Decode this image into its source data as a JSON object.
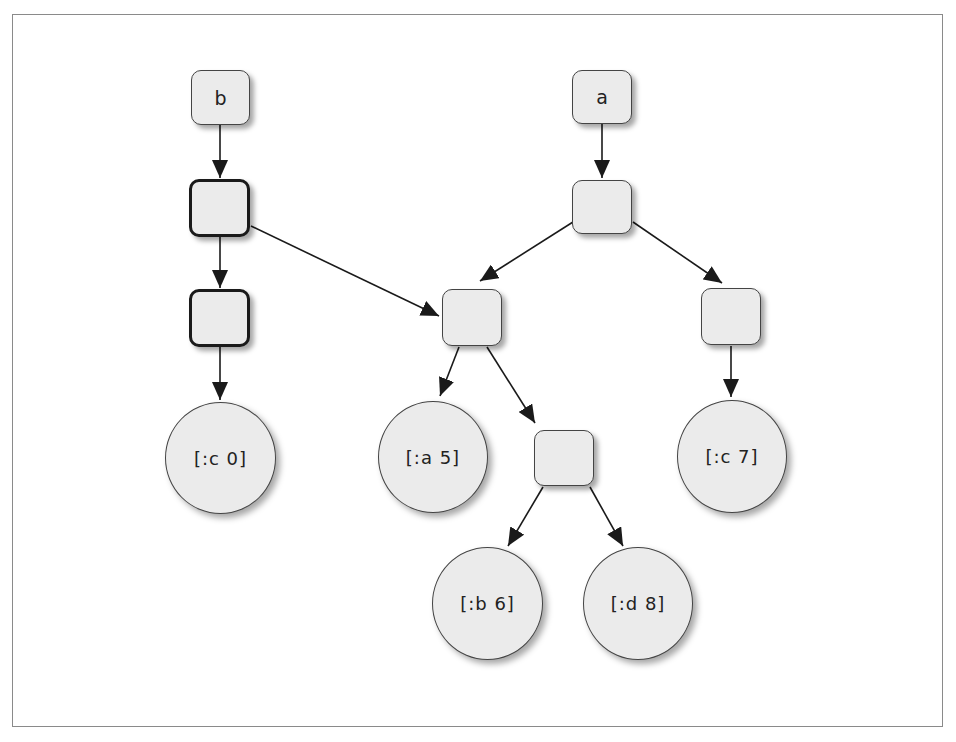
{
  "diagram": {
    "type": "persistent-tree-structural-sharing",
    "roots": [
      {
        "id": "b",
        "label": "b"
      },
      {
        "id": "a",
        "label": "a"
      }
    ],
    "nodes": [
      {
        "id": "b",
        "label": "b",
        "shape": "box"
      },
      {
        "id": "b1",
        "label": "",
        "shape": "box",
        "emphasis": "thick"
      },
      {
        "id": "b2",
        "label": "",
        "shape": "box",
        "emphasis": "thick"
      },
      {
        "id": "c0",
        "label": "[:c 0]",
        "shape": "circle"
      },
      {
        "id": "a",
        "label": "a",
        "shape": "box"
      },
      {
        "id": "a1",
        "label": "",
        "shape": "box"
      },
      {
        "id": "m",
        "label": "",
        "shape": "box"
      },
      {
        "id": "r",
        "label": "",
        "shape": "box"
      },
      {
        "id": "a5",
        "label": "[:a 5]",
        "shape": "circle"
      },
      {
        "id": "n",
        "label": "",
        "shape": "box"
      },
      {
        "id": "c7",
        "label": "[:c 7]",
        "shape": "circle"
      },
      {
        "id": "b6",
        "label": "[:b 6]",
        "shape": "circle"
      },
      {
        "id": "d8",
        "label": "[:d 8]",
        "shape": "circle"
      }
    ],
    "edges": [
      {
        "from": "b",
        "to": "b1"
      },
      {
        "from": "b1",
        "to": "b2"
      },
      {
        "from": "b1",
        "to": "m"
      },
      {
        "from": "b2",
        "to": "c0"
      },
      {
        "from": "a",
        "to": "a1"
      },
      {
        "from": "a1",
        "to": "m"
      },
      {
        "from": "a1",
        "to": "r"
      },
      {
        "from": "m",
        "to": "a5"
      },
      {
        "from": "m",
        "to": "n"
      },
      {
        "from": "r",
        "to": "c7"
      },
      {
        "from": "n",
        "to": "b6"
      },
      {
        "from": "n",
        "to": "d8"
      }
    ]
  },
  "labels": {
    "b": "b",
    "a": "a",
    "c0": "[:c 0]",
    "a5": "[:a 5]",
    "c7": "[:c 7]",
    "b6": "[:b 6]",
    "d8": "[:d 8]"
  },
  "colors": {
    "node_fill": "#ebebeb",
    "node_border": "#444444",
    "thick_border": "#1a1a1a",
    "edge": "#1a1a1a",
    "frame": "#8a8a8a",
    "background": "#ffffff"
  }
}
